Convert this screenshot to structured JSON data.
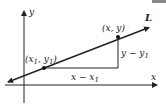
{
  "diagram": {
    "type": "point-slope line diagram",
    "axes": {
      "x_label": "x",
      "y_label": "y"
    },
    "line_label": "L",
    "point1": {
      "label_open": "(x",
      "sub1": "1",
      "comma": ", y",
      "sub2": "1",
      "close": ")"
    },
    "point2": {
      "label": "(x, y)"
    },
    "run_label": {
      "main": "x − x",
      "sub": "1"
    },
    "rise_label": {
      "main": "y − y",
      "sub": "1"
    },
    "colors": {
      "stroke": "#222222",
      "corner_bar": "#888888"
    }
  }
}
